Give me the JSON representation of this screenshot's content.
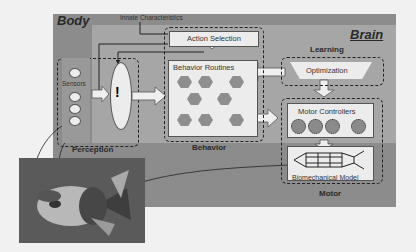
{
  "regions": {
    "body": "Body",
    "brain": "Brain",
    "innate": "Innate Characteristics"
  },
  "modules": {
    "perception": {
      "title": "Perception",
      "sensors_label": "Sensors",
      "filter_symbol": "!"
    },
    "behavior": {
      "title": "Behavior",
      "action_selection": "Action Selection",
      "routines": "Behavior Routines"
    },
    "learning": {
      "title": "Learning",
      "optimization": "Optimization"
    },
    "motor": {
      "title": "Motor",
      "controllers": "Motor Controllers",
      "biomech": "Biomechanical Model"
    }
  },
  "colors": {
    "body_region": "#8c8c8c",
    "brain_region": "#a6a6a6",
    "box_fill": "#ececec",
    "hexagon": "#8e8e8e"
  }
}
